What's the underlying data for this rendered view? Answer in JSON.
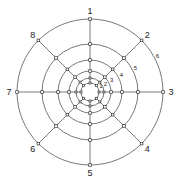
{
  "diagram": {
    "type": "concentric-radial-grid",
    "center": {
      "x": 90,
      "y": 92
    },
    "rings": [
      {
        "label": "1",
        "radius": 9
      },
      {
        "label": "2",
        "radius": 14
      },
      {
        "label": "3",
        "radius": 21
      },
      {
        "label": "4",
        "radius": 32
      },
      {
        "label": "5",
        "radius": 48
      },
      {
        "label": "6",
        "radius": 73
      }
    ],
    "ring_label_angle_deg": 62,
    "spokes": [
      {
        "label": "1",
        "angle_deg": 0
      },
      {
        "label": "2",
        "angle_deg": 45
      },
      {
        "label": "3",
        "angle_deg": 90
      },
      {
        "label": "4",
        "angle_deg": 135
      },
      {
        "label": "5",
        "angle_deg": 180
      },
      {
        "label": "6",
        "angle_deg": 225
      },
      {
        "label": "7",
        "angle_deg": 270
      },
      {
        "label": "8",
        "angle_deg": 315
      }
    ],
    "spoke_inner_radius": 9,
    "node_marker": "small-open-square",
    "colors": {
      "line": "#555555",
      "node_stroke": "#333333",
      "text": "#222222",
      "background": "#ffffff"
    }
  }
}
